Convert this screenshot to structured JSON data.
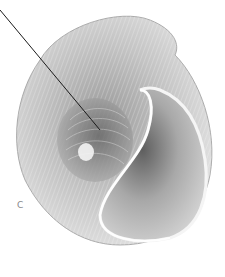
{
  "figure": {
    "panel_label": "C",
    "leader_line": {
      "from": [
        0,
        10
      ],
      "to": [
        100,
        130
      ]
    },
    "colors": {
      "background": "#ffffff",
      "shell_light": "#e8e8e8",
      "shell_mid": "#b8b8b8",
      "shell_dark": "#6e6e6e",
      "line": "#1a1a1a"
    }
  }
}
